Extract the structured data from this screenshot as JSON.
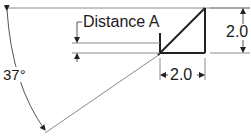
{
  "diagram": {
    "angle_label": "37°",
    "distance_label": "Distance A",
    "height_dimension": "2.0",
    "width_dimension": "2.0",
    "colors": {
      "line": "#222222",
      "thin_line": "#8a8a8a",
      "background": "#ffffff"
    }
  }
}
